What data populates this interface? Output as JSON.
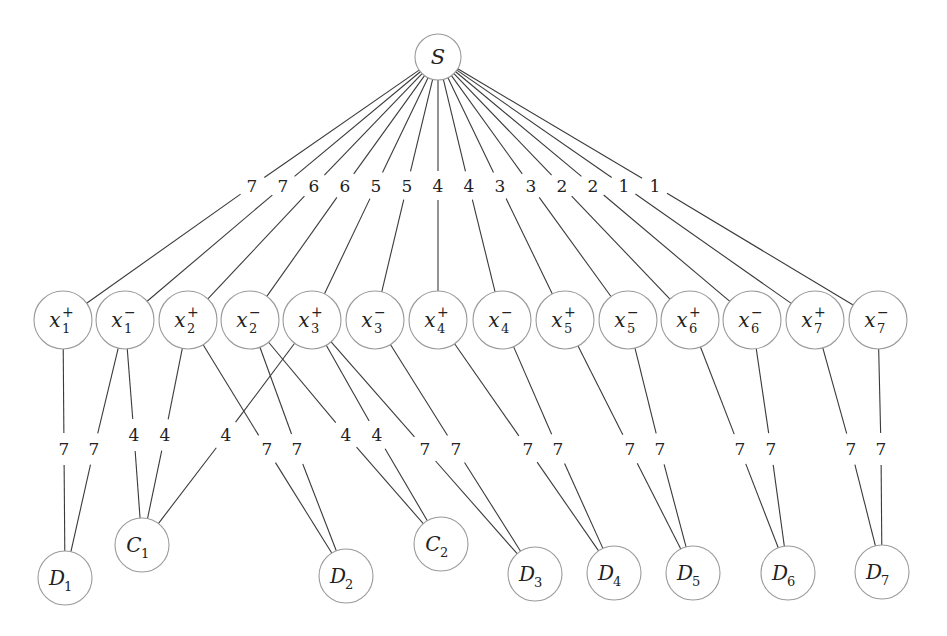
{
  "diagram": {
    "type": "weighted-graph",
    "colors": {
      "edge": "#3a3a3a",
      "node_outline": "#9a9a9a",
      "text": "#222222",
      "background": "#ffffff"
    },
    "source": {
      "id": "S",
      "label": "S",
      "cx": 438,
      "cy": 57,
      "r": 23
    },
    "literals": [
      {
        "id": "x1p",
        "base": "x",
        "sub": "1",
        "sup": "+",
        "cx": 63,
        "cy": 320
      },
      {
        "id": "x1m",
        "base": "x",
        "sub": "1",
        "sup": "−",
        "cx": 125,
        "cy": 320
      },
      {
        "id": "x2p",
        "base": "x",
        "sub": "2",
        "sup": "+",
        "cx": 188,
        "cy": 320
      },
      {
        "id": "x2m",
        "base": "x",
        "sub": "2",
        "sup": "−",
        "cx": 250,
        "cy": 320
      },
      {
        "id": "x3p",
        "base": "x",
        "sub": "3",
        "sup": "+",
        "cx": 312,
        "cy": 320
      },
      {
        "id": "x3m",
        "base": "x",
        "sub": "3",
        "sup": "−",
        "cx": 375,
        "cy": 320
      },
      {
        "id": "x4p",
        "base": "x",
        "sub": "4",
        "sup": "+",
        "cx": 438,
        "cy": 320
      },
      {
        "id": "x4m",
        "base": "x",
        "sub": "4",
        "sup": "−",
        "cx": 502,
        "cy": 320
      },
      {
        "id": "x5p",
        "base": "x",
        "sub": "5",
        "sup": "+",
        "cx": 565,
        "cy": 320
      },
      {
        "id": "x5m",
        "base": "x",
        "sub": "5",
        "sup": "−",
        "cx": 628,
        "cy": 320
      },
      {
        "id": "x6p",
        "base": "x",
        "sub": "6",
        "sup": "+",
        "cx": 690,
        "cy": 320
      },
      {
        "id": "x6m",
        "base": "x",
        "sub": "6",
        "sup": "−",
        "cx": 752,
        "cy": 320
      },
      {
        "id": "x7p",
        "base": "x",
        "sub": "7",
        "sup": "+",
        "cx": 815,
        "cy": 320
      },
      {
        "id": "x7m",
        "base": "x",
        "sub": "7",
        "sup": "−",
        "cx": 878,
        "cy": 320
      }
    ],
    "literal_radius": 29,
    "bottom_nodes": [
      {
        "id": "D1",
        "base": "D",
        "sub": "1",
        "cx": 65,
        "cy": 578
      },
      {
        "id": "C1",
        "base": "C",
        "sub": "1",
        "cx": 142,
        "cy": 545
      },
      {
        "id": "D2",
        "base": "D",
        "sub": "2",
        "cx": 346,
        "cy": 576
      },
      {
        "id": "C2",
        "base": "C",
        "sub": "2",
        "cx": 441,
        "cy": 544
      },
      {
        "id": "D3",
        "base": "D",
        "sub": "3",
        "cx": 535,
        "cy": 574
      },
      {
        "id": "D4",
        "base": "D",
        "sub": "4",
        "cx": 614,
        "cy": 573
      },
      {
        "id": "D5",
        "base": "D",
        "sub": "5",
        "cx": 693,
        "cy": 573
      },
      {
        "id": "D6",
        "base": "D",
        "sub": "6",
        "cx": 788,
        "cy": 573
      },
      {
        "id": "D7",
        "base": "D",
        "sub": "7",
        "cx": 882,
        "cy": 572
      }
    ],
    "bottom_radius": 27,
    "source_edges": [
      {
        "to": "x1p",
        "weight": "7",
        "lx": 252,
        "ly": 186
      },
      {
        "to": "x1m",
        "weight": "7",
        "lx": 283,
        "ly": 186
      },
      {
        "to": "x2p",
        "weight": "6",
        "lx": 314,
        "ly": 186
      },
      {
        "to": "x2m",
        "weight": "6",
        "lx": 345,
        "ly": 186
      },
      {
        "to": "x3p",
        "weight": "5",
        "lx": 376,
        "ly": 186
      },
      {
        "to": "x3m",
        "weight": "5",
        "lx": 407,
        "ly": 186
      },
      {
        "to": "x4p",
        "weight": "4",
        "lx": 438,
        "ly": 186
      },
      {
        "to": "x4m",
        "weight": "4",
        "lx": 469,
        "ly": 186
      },
      {
        "to": "x5p",
        "weight": "3",
        "lx": 500,
        "ly": 186
      },
      {
        "to": "x5m",
        "weight": "3",
        "lx": 531,
        "ly": 186
      },
      {
        "to": "x6p",
        "weight": "2",
        "lx": 562,
        "ly": 186
      },
      {
        "to": "x6m",
        "weight": "2",
        "lx": 593,
        "ly": 186
      },
      {
        "to": "x7p",
        "weight": "1",
        "lx": 624,
        "ly": 186
      },
      {
        "to": "x7m",
        "weight": "1",
        "lx": 655,
        "ly": 186
      }
    ],
    "lower_edges": [
      {
        "from": "x1p",
        "to": "D1",
        "weight": "7",
        "lx": 64,
        "ly": 449
      },
      {
        "from": "x1m",
        "to": "D1",
        "weight": "7",
        "lx": 94,
        "ly": 449
      },
      {
        "from": "x1m",
        "to": "C1",
        "weight": "4",
        "lx": 134,
        "ly": 435
      },
      {
        "from": "x2p",
        "to": "C1",
        "weight": "4",
        "lx": 165,
        "ly": 435
      },
      {
        "from": "x3p",
        "to": "C1",
        "weight": "4",
        "lx": 226,
        "ly": 435
      },
      {
        "from": "x2p",
        "to": "D2",
        "weight": "7",
        "lx": 267,
        "ly": 449
      },
      {
        "from": "x2m",
        "to": "D2",
        "weight": "7",
        "lx": 297,
        "ly": 449
      },
      {
        "from": "x2m",
        "to": "C2",
        "weight": "4",
        "lx": 346,
        "ly": 435
      },
      {
        "from": "x3p",
        "to": "C2",
        "weight": "4",
        "lx": 377,
        "ly": 435
      },
      {
        "from": "x3p",
        "to": "D3",
        "weight": "7",
        "lx": 425,
        "ly": 449
      },
      {
        "from": "x3m",
        "to": "D3",
        "weight": "7",
        "lx": 456,
        "ly": 449
      },
      {
        "from": "x4p",
        "to": "D4",
        "weight": "7",
        "lx": 528,
        "ly": 449
      },
      {
        "from": "x4m",
        "to": "D4",
        "weight": "7",
        "lx": 558,
        "ly": 449
      },
      {
        "from": "x5p",
        "to": "D5",
        "weight": "7",
        "lx": 630,
        "ly": 449
      },
      {
        "from": "x5m",
        "to": "D5",
        "weight": "7",
        "lx": 660,
        "ly": 449
      },
      {
        "from": "x6p",
        "to": "D6",
        "weight": "7",
        "lx": 740,
        "ly": 449
      },
      {
        "from": "x6m",
        "to": "D6",
        "weight": "7",
        "lx": 771,
        "ly": 449
      },
      {
        "from": "x7p",
        "to": "D7",
        "weight": "7",
        "lx": 851,
        "ly": 449
      },
      {
        "from": "x7m",
        "to": "D7",
        "weight": "7",
        "lx": 881,
        "ly": 449
      }
    ]
  }
}
